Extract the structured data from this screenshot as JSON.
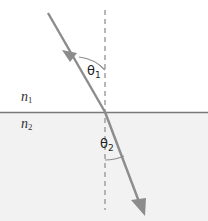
{
  "figure": {
    "labels": {
      "medium_upper": {
        "symbol": "n",
        "subscript": "1",
        "text": "n₁"
      },
      "medium_lower": {
        "symbol": "n",
        "subscript": "2",
        "text": "n₂"
      },
      "angle_incidence": {
        "symbol": "θ",
        "subscript": "1",
        "text": "θ₁"
      },
      "angle_refraction": {
        "symbol": "θ",
        "subscript": "2",
        "text": "θ₂"
      }
    },
    "colors": {
      "ray": "#8c8c8c",
      "interface_line": "#7a7a7a",
      "normal_dashed": "#9a9a9a",
      "lower_medium_fill": "#f2f2f2",
      "upper_medium_fill": "#ffffff",
      "arc": "#8c8c8c",
      "text": "#303030"
    },
    "geometry": {
      "interface_y": 112,
      "normal_x": 105,
      "normal_top_y": 10,
      "normal_bottom_y": 210,
      "incident_ray": {
        "x1": 48,
        "y1": 13,
        "x2": 105,
        "y2": 112
      },
      "refracted_ray": {
        "x1": 105,
        "y1": 112,
        "x2": 143,
        "y2": 212
      },
      "incident_arrow_at": {
        "x": 69,
        "y": 59
      },
      "refracted_arrow_at": {
        "x": 143,
        "y": 212
      }
    }
  }
}
